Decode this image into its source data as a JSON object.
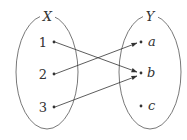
{
  "diagram": {
    "type": "set-mapping",
    "sets": [
      {
        "name": "X",
        "elements": [
          "1",
          "2",
          "3"
        ]
      },
      {
        "name": "Y",
        "elements": [
          "a",
          "b",
          "c"
        ]
      }
    ],
    "mappings": [
      {
        "from": "1",
        "to": "b"
      },
      {
        "from": "2",
        "to": "a"
      },
      {
        "from": "3",
        "to": "b"
      }
    ]
  },
  "labels": {
    "set_x": "X",
    "set_y": "Y",
    "x1": "1",
    "x2": "2",
    "x3": "3",
    "ya": "a",
    "yb": "b",
    "yc": "c"
  }
}
